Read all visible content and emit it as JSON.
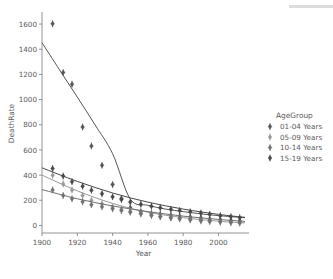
{
  "chart_data": {
    "type": "scatter",
    "title": "",
    "xlabel": "Year",
    "ylabel": "DeathRate",
    "xlim": [
      1900,
      2015
    ],
    "ylim": [
      -60,
      1680
    ],
    "xticks": [
      1900,
      1920,
      1940,
      1960,
      1980,
      2000
    ],
    "yticks": [
      0,
      200,
      400,
      600,
      800,
      1000,
      1200,
      1400,
      1600
    ],
    "grid": false,
    "legend_position": "right",
    "legend_title": "AgeGroup",
    "markers": "diamond-with-errorbar",
    "series": [
      {
        "name": "01-04 Years",
        "color": "#555555",
        "x": [
          1906,
          1912,
          1917,
          1923,
          1928,
          1934,
          1940,
          1945,
          1950,
          1956,
          1962,
          1967,
          1973,
          1978,
          1984,
          1990,
          1995,
          2001,
          2007,
          2012
        ],
        "values": [
          1603,
          1215,
          1122,
          782,
          632,
          478,
          325,
          215,
          140,
          110,
          95,
          88,
          80,
          74,
          68,
          60,
          52,
          46,
          40,
          36
        ],
        "fit_x": [
          1900,
          1910,
          1920,
          1930,
          1940,
          1950,
          1960,
          1970,
          1980,
          1990,
          2000,
          2015
        ],
        "fit_y": [
          1452,
          1235,
          1020,
          800,
          570,
          210,
          160,
          130,
          110,
          92,
          78,
          62
        ]
      },
      {
        "name": "05-09 Years",
        "color": "#9a9a9a",
        "x": [
          1906,
          1912,
          1917,
          1923,
          1928,
          1934,
          1940,
          1945,
          1950,
          1956,
          1962,
          1967,
          1973,
          1978,
          1984,
          1990,
          1995,
          2001,
          2007,
          2012
        ],
        "values": [
          398,
          330,
          282,
          238,
          200,
          172,
          148,
          128,
          112,
          96,
          82,
          70,
          60,
          52,
          44,
          36,
          30,
          25,
          21,
          18
        ],
        "fit_x": [
          1900,
          1920,
          1940,
          1960,
          1980,
          2000,
          2015
        ],
        "fit_y": [
          400,
          275,
          175,
          105,
          62,
          34,
          20
        ]
      },
      {
        "name": "10-14 Years",
        "color": "#6f6f6f",
        "x": [
          1906,
          1912,
          1917,
          1923,
          1928,
          1934,
          1940,
          1945,
          1950,
          1956,
          1962,
          1967,
          1973,
          1978,
          1984,
          1990,
          1995,
          2001,
          2007,
          2012
        ],
        "values": [
          282,
          238,
          212,
          188,
          165,
          148,
          132,
          118,
          105,
          92,
          80,
          70,
          62,
          55,
          48,
          42,
          36,
          31,
          27,
          24
        ],
        "fit_x": [
          1900,
          1920,
          1940,
          1960,
          1980,
          2000,
          2015
        ],
        "fit_y": [
          285,
          212,
          155,
          110,
          74,
          48,
          32
        ]
      },
      {
        "name": "15-19 Years",
        "color": "#474747",
        "x": [
          1906,
          1912,
          1917,
          1923,
          1928,
          1934,
          1940,
          1945,
          1950,
          1956,
          1962,
          1967,
          1973,
          1978,
          1984,
          1990,
          1995,
          2001,
          2007,
          2012
        ],
        "values": [
          452,
          392,
          348,
          312,
          280,
          252,
          228,
          206,
          186,
          168,
          152,
          140,
          128,
          118,
          108,
          98,
          88,
          78,
          70,
          62
        ],
        "fit_x": [
          1900,
          1920,
          1940,
          1960,
          1980,
          2000,
          2015
        ],
        "fit_y": [
          458,
          350,
          258,
          185,
          130,
          88,
          64
        ]
      }
    ]
  },
  "legend": {
    "title": "AgeGroup",
    "items": [
      {
        "label": "01-04 Years"
      },
      {
        "label": "05-09 Years"
      },
      {
        "label": "10-14 Years"
      },
      {
        "label": "15-19 Years"
      }
    ]
  },
  "axes": {
    "x_title": "Year",
    "y_title": "DeathRate",
    "x_ticklabels": [
      "1900",
      "1920",
      "1940",
      "1960",
      "1980",
      "2000"
    ],
    "y_ticklabels": [
      "0",
      "200",
      "400",
      "600",
      "800",
      "1000",
      "1200",
      "1400",
      "1600"
    ]
  }
}
